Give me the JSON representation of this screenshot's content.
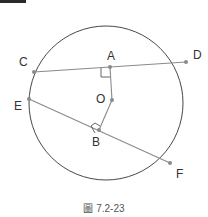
{
  "figure": {
    "caption": "圖 7.2-23",
    "circle": {
      "center": "O",
      "stroke": "#333333"
    },
    "points": {
      "A": "A",
      "B": "B",
      "C": "C",
      "D": "D",
      "E": "E",
      "F": "F",
      "O": "O"
    },
    "chords": [
      {
        "from": "C",
        "to": "D",
        "midpoint": "A"
      },
      {
        "from": "E",
        "to": "F",
        "midpoint": "B"
      }
    ],
    "segments": [
      {
        "from": "O",
        "to": "A",
        "perpendicular_to": "CD"
      },
      {
        "from": "O",
        "to": "B",
        "perpendicular_to": "EF"
      }
    ],
    "line_color": "#8a8a8a",
    "point_color": "#8a8a8a"
  }
}
